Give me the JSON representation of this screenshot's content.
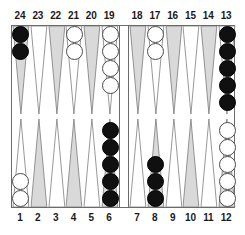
{
  "board": {
    "title": "backgammon-board",
    "colors": {
      "frame": "#6b6b6b",
      "point_shaded": "#d9d9d9",
      "point_plain": "#ffffff",
      "checker_black": "#101010",
      "checker_white": "#ffffff",
      "background": "#ffffff",
      "label_text": "#1a1a1a"
    },
    "top_labels_left": [
      "24",
      "23",
      "22",
      "21",
      "20",
      "19"
    ],
    "top_labels_right": [
      "18",
      "17",
      "16",
      "15",
      "14",
      "13"
    ],
    "bottom_labels_left": [
      "1",
      "2",
      "3",
      "4",
      "5",
      "6"
    ],
    "bottom_labels_right": [
      "7",
      "8",
      "9",
      "10",
      "11",
      "12"
    ],
    "quadrants": {
      "top_left": [
        {
          "label": "24",
          "shade": "shaded",
          "checkers": 2,
          "color": "black"
        },
        {
          "label": "23",
          "shade": "plain",
          "checkers": 0,
          "color": "none"
        },
        {
          "label": "22",
          "shade": "shaded",
          "checkers": 0,
          "color": "none"
        },
        {
          "label": "21",
          "shade": "plain",
          "checkers": 2,
          "color": "white"
        },
        {
          "label": "20",
          "shade": "shaded",
          "checkers": 0,
          "color": "none"
        },
        {
          "label": "19",
          "shade": "plain",
          "checkers": 4,
          "color": "white"
        }
      ],
      "top_right": [
        {
          "label": "18",
          "shade": "shaded",
          "checkers": 0,
          "color": "none"
        },
        {
          "label": "17",
          "shade": "plain",
          "checkers": 2,
          "color": "white"
        },
        {
          "label": "16",
          "shade": "shaded",
          "checkers": 0,
          "color": "none"
        },
        {
          "label": "15",
          "shade": "plain",
          "checkers": 0,
          "color": "none"
        },
        {
          "label": "14",
          "shade": "shaded",
          "checkers": 0,
          "color": "none"
        },
        {
          "label": "13",
          "shade": "plain",
          "checkers": 5,
          "color": "black"
        }
      ],
      "bottom_left": [
        {
          "label": "1",
          "shade": "plain",
          "checkers": 2,
          "color": "white"
        },
        {
          "label": "2",
          "shade": "shaded",
          "checkers": 0,
          "color": "none"
        },
        {
          "label": "3",
          "shade": "plain",
          "checkers": 0,
          "color": "none"
        },
        {
          "label": "4",
          "shade": "shaded",
          "checkers": 0,
          "color": "none"
        },
        {
          "label": "5",
          "shade": "plain",
          "checkers": 0,
          "color": "none"
        },
        {
          "label": "6",
          "shade": "shaded",
          "checkers": 5,
          "color": "black"
        }
      ],
      "bottom_right": [
        {
          "label": "7",
          "shade": "plain",
          "checkers": 0,
          "color": "none"
        },
        {
          "label": "8",
          "shade": "shaded",
          "checkers": 3,
          "color": "black"
        },
        {
          "label": "9",
          "shade": "plain",
          "checkers": 0,
          "color": "none"
        },
        {
          "label": "10",
          "shade": "shaded",
          "checkers": 0,
          "color": "none"
        },
        {
          "label": "11",
          "shade": "plain",
          "checkers": 0,
          "color": "none"
        },
        {
          "label": "12",
          "shade": "shaded",
          "checkers": 5,
          "color": "white"
        }
      ]
    },
    "bar": {
      "black_checkers": 0,
      "white_checkers": 0
    }
  }
}
